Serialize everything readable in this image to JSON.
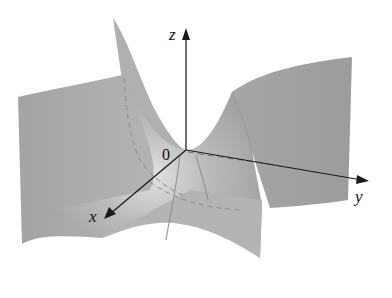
{
  "figure": {
    "surface_color": "#a6a6a6",
    "surface_highlight": "#d8d8d8",
    "axis_color": "#1a1a1a"
  },
  "axes": {
    "z_label": "z",
    "y_label": "y",
    "x_label": "x",
    "origin_label": "0"
  }
}
